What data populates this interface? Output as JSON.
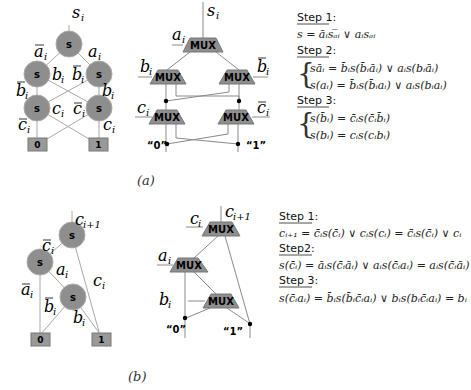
{
  "figure_a": {
    "caption": "(a)",
    "bdd": {
      "node_label": "s",
      "top_var": "s",
      "top_sub": "i",
      "edges": {
        "a_bar": "a",
        "a": "a",
        "b_left": "b",
        "b_bar_right": "b",
        "b_bar_left": "b",
        "b_right": "b",
        "c_mid_left": "c",
        "c_bar_mid": "c",
        "c_bar_left": "c",
        "c_right": "c"
      },
      "sub_i": "i",
      "terminals": [
        "0",
        "1"
      ]
    },
    "mux": {
      "mux_label": "MUX",
      "out_var": "s",
      "out_sub": "i",
      "sel_a": "a",
      "sel_b": "b",
      "sel_b_bar": "b",
      "sel_c": "c",
      "sel_c_bar": "c",
      "sub_i": "i",
      "const0": "“0”",
      "const1": "“1”"
    },
    "equations": {
      "step1_label": "Step 1:",
      "step1_eq": "s = āᵢsₐ̅ᵢ ∨ aᵢsₐᵢ",
      "step2_label": "Step 2:",
      "step2_eq1": "sāᵢ = b̄ᵢs(b̄ᵢāᵢ) ∨ aᵢs(bᵢāᵢ)",
      "step2_eq2": "s(aᵢ) = b̄ᵢs(b̄ᵢaᵢ) ∨ aᵢs(bᵢaᵢ)",
      "step3_label": "Step 3:",
      "step3_eq1": "s(b̄ᵢ) = c̄ᵢs(c̄ᵢb̄ᵢ)",
      "step3_eq2": "s(bᵢ) = cᵢs(cᵢbᵢ)"
    }
  },
  "figure_b": {
    "caption": "(b)",
    "bdd": {
      "node_label": "s",
      "top_var": "c",
      "top_sub": "i+1",
      "edge_c_bar": "c",
      "edge_a": "a",
      "edge_a_bar": "a",
      "edge_c": "c",
      "edge_b_bar": "b",
      "edge_b": "b",
      "sub_i": "i",
      "terminals": [
        "0",
        "1"
      ]
    },
    "mux": {
      "mux_label": "MUX",
      "out_var": "c",
      "out_sub": "i+1",
      "sel_c": "c",
      "sel_a": "a",
      "sel_b": "b",
      "sub_i": "i",
      "const0": "“0”",
      "const1": "“1”"
    },
    "equations": {
      "step1_label": "Step 1:",
      "step1_eq": "cᵢ₊₁ = c̄ᵢs(c̄ᵢ) ∨ cᵢs(cᵢ) = c̄ᵢs(c̄ᵢ) ∨ cᵢ",
      "step2_label": "Step2:",
      "step2_eq": "s(c̄ᵢ) = āᵢs(c̄ᵢāᵢ) ∨ aᵢs(c̄ᵢaᵢ) = aᵢs(c̄ᵢāᵢ)",
      "step3_label": "Step 3:",
      "step3_eq": "s(c̄ᵢaᵢ) = b̄ᵢs(b̄ᵢc̄ᵢaᵢ) ∨ bᵢs(bᵢc̄ᵢaᵢ) = bᵢ"
    }
  }
}
